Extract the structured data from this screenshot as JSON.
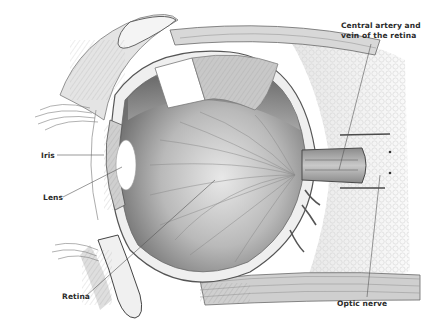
{
  "figure": {
    "colors": {
      "background": "#ffffff",
      "tissue_dark": "#6e6e6e",
      "tissue_mid": "#9a9a9a",
      "tissue_light": "#d4d4d4",
      "outline": "#4a4a4a",
      "label_text": "#2a2a2a",
      "leader_line": "#555555"
    }
  },
  "labels": [
    {
      "id": "central-artery",
      "text": "Central artery and\nvein of the retina",
      "x": 341,
      "y": 21
    },
    {
      "id": "iris",
      "text": "Iris",
      "x": 41,
      "y": 151
    },
    {
      "id": "lens",
      "text": "Lens",
      "x": 43,
      "y": 193
    },
    {
      "id": "retina",
      "text": "Retina",
      "x": 62,
      "y": 292
    },
    {
      "id": "optic-nerve",
      "text": "Optic nerve",
      "x": 337,
      "y": 299
    }
  ],
  "leaders": [
    {
      "id": "central-artery",
      "x1": 371,
      "y1": 44,
      "x2": 339,
      "y2": 170
    },
    {
      "id": "iris",
      "x1": 57,
      "y1": 155,
      "x2": 104,
      "y2": 155
    },
    {
      "id": "lens",
      "x1": 63,
      "y1": 197,
      "x2": 122,
      "y2": 167
    },
    {
      "id": "retina",
      "x1": 86,
      "y1": 296,
      "x2": 215,
      "y2": 180
    },
    {
      "id": "optic-nerve",
      "x1": 367,
      "y1": 297,
      "x2": 380,
      "y2": 175
    }
  ]
}
